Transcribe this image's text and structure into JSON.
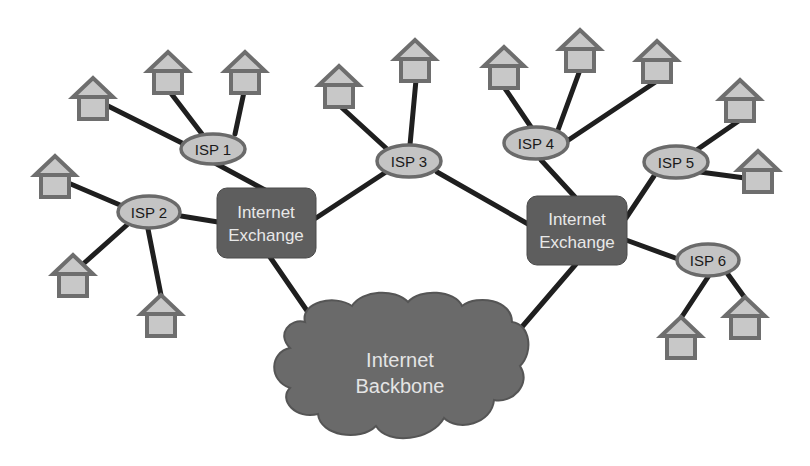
{
  "diagram": {
    "colors": {
      "link": "#1f1f1f",
      "house_fill": "#c8c8c8",
      "house_stroke": "#6e6e6e",
      "isp_fill": "#c4c4c4",
      "exchange_fill": "#5e5e5e",
      "cloud_fill": "#6a6a6a",
      "light_text": "#e8e8e8"
    },
    "backbone": {
      "label_line1": "Internet",
      "label_line2": "Backbone"
    },
    "exchanges": [
      {
        "id": "ix-left",
        "label_line1": "Internet",
        "label_line2": "Exchange"
      },
      {
        "id": "ix-right",
        "label_line1": "Internet",
        "label_line2": "Exchange"
      }
    ],
    "isps": [
      {
        "id": "isp1",
        "label": "ISP 1",
        "connected_to": "ix-left",
        "customers": 3
      },
      {
        "id": "isp2",
        "label": "ISP 2",
        "connected_to": "ix-left",
        "customers": 3
      },
      {
        "id": "isp3",
        "label": "ISP 3",
        "connected_to": [
          "ix-left",
          "ix-right"
        ],
        "customers": 2
      },
      {
        "id": "isp4",
        "label": "ISP 4",
        "connected_to": "ix-right",
        "customers": 3
      },
      {
        "id": "isp5",
        "label": "ISP 5",
        "connected_to": "ix-right",
        "customers": 2
      },
      {
        "id": "isp6",
        "label": "ISP 6",
        "connected_to": "ix-right",
        "customers": 2
      }
    ],
    "house_icon": "house-icon"
  }
}
